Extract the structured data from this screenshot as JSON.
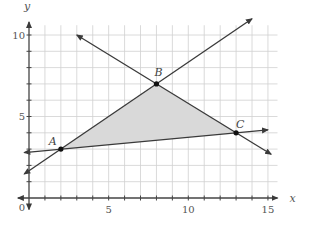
{
  "chart_data": {
    "type": "line",
    "title": "",
    "xlabel": "x",
    "ylabel": "y",
    "xlim": [
      0,
      15.5
    ],
    "ylim": [
      0,
      10.5
    ],
    "grid": true,
    "x_ticks": [
      0,
      5,
      10,
      15
    ],
    "y_ticks": [
      5,
      10
    ],
    "x_tick_labels": [
      "0",
      "5",
      "10",
      "15"
    ],
    "y_tick_labels": [
      "5",
      "10"
    ],
    "origin_label": "0",
    "points": [
      {
        "label": "A",
        "x": 2,
        "y": 3
      },
      {
        "label": "B",
        "x": 8,
        "y": 7
      },
      {
        "label": "C",
        "x": 13,
        "y": 4
      }
    ],
    "series": [
      {
        "name": "line AC",
        "x": [
          -0.3,
          15
        ],
        "y": [
          2.79,
          4.18
        ]
      },
      {
        "name": "line AB",
        "x": [
          -0.3,
          14
        ],
        "y": [
          1.47,
          11
        ]
      },
      {
        "name": "line BC",
        "x": [
          3,
          15.2
        ],
        "y": [
          10,
          2.68
        ]
      }
    ],
    "shaded_region": {
      "vertices": [
        [
          2,
          3
        ],
        [
          8,
          7
        ],
        [
          13,
          4
        ]
      ],
      "color": "#d9d9d9"
    },
    "colors": {
      "grid": "#d0d0d0",
      "axis": "#444444",
      "line": "#3a3a3a",
      "point": "#111111",
      "fill": "#d9d9d9"
    }
  }
}
